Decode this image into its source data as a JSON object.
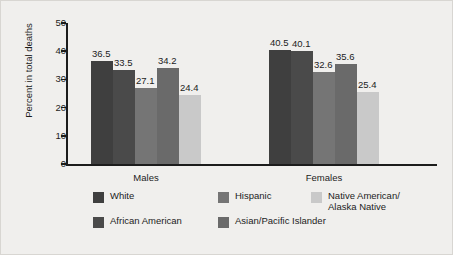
{
  "chart_data": {
    "type": "bar",
    "title": "",
    "xlabel": "",
    "ylabel": "Percent in total deaths",
    "ylim": [
      0,
      50
    ],
    "yticks": [
      0,
      10,
      20,
      30,
      40,
      50
    ],
    "grid": false,
    "legend_position": "bottom",
    "categories": [
      "Males",
      "Females"
    ],
    "series": [
      {
        "name": "White",
        "color": "#3f3f3f",
        "values": [
          36.5,
          40.5
        ]
      },
      {
        "name": "African American",
        "color": "#4a4a4a",
        "values": [
          33.5,
          40.1
        ]
      },
      {
        "name": "Hispanic",
        "color": "#757575",
        "values": [
          27.1,
          32.6
        ]
      },
      {
        "name": "Asian/Pacific Islander",
        "color": "#6a6a6a",
        "values": [
          34.2,
          35.6
        ]
      },
      {
        "name": "Native American/\nAlaska Native",
        "color": "#c9c9c9",
        "values": [
          24.4,
          25.4
        ]
      }
    ],
    "value_labels": {
      "Males": [
        "36.5",
        "33.5",
        "27.1",
        "34.2",
        "24.4"
      ],
      "Females": [
        "40.5",
        "40.1",
        "32.6",
        "35.6",
        "25.4"
      ]
    }
  },
  "axis": {
    "y_title": "Percent in total deaths",
    "y_tick_labels": [
      "50",
      "40",
      "30",
      "20",
      "10",
      "0"
    ],
    "x_group_labels": [
      "Males",
      "Females"
    ]
  },
  "legend": {
    "items": [
      {
        "label": "White",
        "color": "#3f3f3f"
      },
      {
        "label": "Hispanic",
        "color": "#757575"
      },
      {
        "label": "Native American/\nAlaska Native",
        "color": "#c9c9c9"
      },
      {
        "label": "African American",
        "color": "#4a4a4a"
      },
      {
        "label": "Asian/Pacific Islander",
        "color": "#6a6a6a"
      }
    ]
  },
  "colors": {
    "background": "#f0efed",
    "axis": "#1c1c1c",
    "text": "#1c1c1c"
  }
}
